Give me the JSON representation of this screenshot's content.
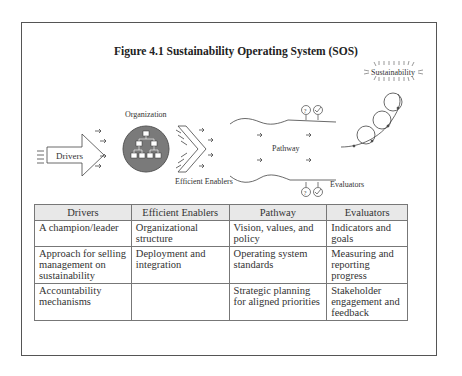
{
  "figure": {
    "title": "Figure 4.1 Sustainability Operating System (SOS)",
    "diagram_labels": {
      "drivers": "Drivers",
      "organization": "Organization",
      "efficient_enablers": "Efficient Enablers",
      "pathway": "Pathway",
      "evaluators": "Evaluators",
      "sustainability": "Sustainability"
    },
    "colors": {
      "frame": "#555555",
      "org_circle": "#7a7a7a",
      "table_header_bg": "#e8e8e8"
    }
  },
  "table": {
    "headers": [
      "Drivers",
      "Efficient Enablers",
      "Pathway",
      "Evaluators"
    ],
    "rows": [
      [
        "A champion/leader",
        "Organizational structure",
        "Vision, values, and policy",
        "Indicators and goals"
      ],
      [
        "Approach for selling management on sustainability",
        "Deployment and integration",
        "Operating system standards",
        "Measuring and reporting progress"
      ],
      [
        "Accountability mechanisms",
        "",
        "Strategic planning for aligned priorities",
        "Stakeholder engagement and feedback"
      ]
    ]
  }
}
